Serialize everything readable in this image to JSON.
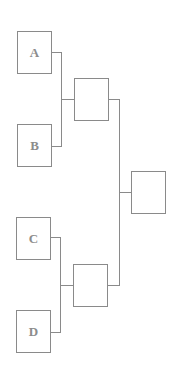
{
  "diagram": {
    "type": "tournament-bracket",
    "line_color": "#8a8a8a",
    "text_color": "#8c8c8c",
    "entrants": [
      {
        "id": "A",
        "label": "A"
      },
      {
        "id": "B",
        "label": "B"
      },
      {
        "id": "C",
        "label": "C"
      },
      {
        "id": "D",
        "label": "D"
      }
    ],
    "semifinals": [
      {
        "id": "AB",
        "label": ""
      },
      {
        "id": "CD",
        "label": ""
      }
    ],
    "final": {
      "id": "final",
      "label": ""
    }
  }
}
